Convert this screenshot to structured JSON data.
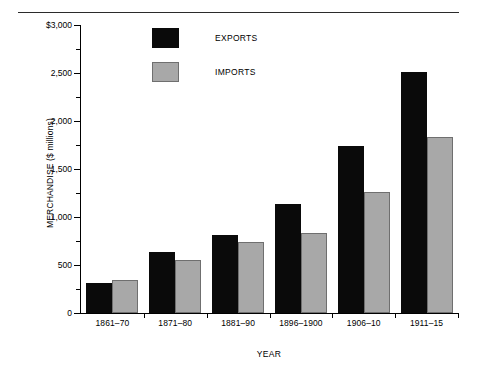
{
  "chart_data": {
    "type": "bar",
    "title": "",
    "xlabel": "YEAR",
    "ylabel": "MERCHANDISE ($ millions)",
    "categories": [
      "1861–70",
      "1871–80",
      "1881–90",
      "1896–1900",
      "1906–10",
      "1911–15"
    ],
    "series": [
      {
        "name": "EXPORTS",
        "color": "#0a0a0a",
        "values": [
          310,
          640,
          810,
          1135,
          1740,
          2510
        ]
      },
      {
        "name": "IMPORTS",
        "color": "#a8a8a8",
        "values": [
          345,
          555,
          735,
          835,
          1265,
          1830
        ]
      }
    ],
    "ylim": [
      0,
      3000
    ],
    "ytick_values": [
      0,
      500,
      1000,
      1500,
      2000,
      2500,
      3000
    ],
    "ytick_labels": [
      "0",
      "500",
      "1,000",
      "1,500",
      "2,000",
      "2,500",
      "$3,000"
    ],
    "yminor_step": 250,
    "grid": false,
    "legend_position": "top-left-inside"
  },
  "legend": {
    "items": [
      {
        "label": "EXPORTS"
      },
      {
        "label": "IMPORTS"
      }
    ]
  }
}
